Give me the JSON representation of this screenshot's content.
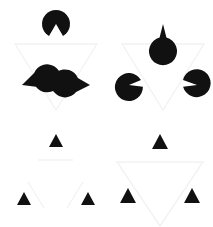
{
  "figure": {
    "background_color": "#ffffff",
    "width": 213,
    "height": 227,
    "grid_rows": 2,
    "grid_cols": 2
  },
  "colors": {
    "inducer_fill": "#111111",
    "illusory_contour": "#f2f2f2",
    "background": "#ffffff"
  },
  "quadrants": [
    {
      "id": "top-left",
      "label": "Pac-man inducers",
      "inducer_type": "pacman-disc",
      "inducer_count": 3,
      "disc_radius": 14,
      "wedge_angle_deg": 60,
      "illusory_shape": "inverted-triangle",
      "contour_visible": "true",
      "inducers": [
        {
          "name": "inducer-top",
          "cx": 56,
          "cy": 24,
          "mouth_direction_deg": 90
        },
        {
          "name": "inducer-bottom-left",
          "cx": 22,
          "cy": 85,
          "mouth_direction_deg": 330
        },
        {
          "name": "inducer-bottom-right",
          "cx": 90,
          "cy": 85,
          "mouth_direction_deg": 210
        }
      ],
      "triangle_points": "15,44 97,44 56,110"
    },
    {
      "id": "top-right",
      "label": "Thin-wedge disc inducers",
      "inducer_type": "thin-wedge-disc",
      "inducer_count": 3,
      "disc_radius": 14,
      "wedge_angle_deg": 28,
      "illusory_shape": "inverted-triangle",
      "contour_visible": "true",
      "inducers": [
        {
          "name": "inducer-top",
          "cx": 56,
          "cy": 24,
          "mouth_direction_deg": 90
        },
        {
          "name": "inducer-bottom-left",
          "cx": 22,
          "cy": 85,
          "mouth_direction_deg": 330
        },
        {
          "name": "inducer-bottom-right",
          "cx": 90,
          "cy": 85,
          "mouth_direction_deg": 210
        }
      ],
      "triangle_points": "15,44 97,44 56,110"
    },
    {
      "id": "bottom-left",
      "label": "Bare wedge inducers",
      "inducer_type": "bare-wedge",
      "inducer_count": 3,
      "wedge_size": 13,
      "wedge_angle_deg": 60,
      "illusory_shape": "inverted-triangle",
      "contour_visible": "partial",
      "inducers": [
        {
          "name": "inducer-top",
          "cx": 56,
          "cy": 28,
          "mouth_direction_deg": 90
        },
        {
          "name": "inducer-bottom-left",
          "cx": 24,
          "cy": 86,
          "mouth_direction_deg": 330
        },
        {
          "name": "inducer-bottom-right",
          "cx": 88,
          "cy": 86,
          "mouth_direction_deg": 210
        }
      ],
      "triangle_points": "15,44 97,44 56,110"
    },
    {
      "id": "bottom-right",
      "label": "Bare wedge inducers with contour",
      "inducer_type": "bare-wedge",
      "inducer_count": 3,
      "wedge_size": 15,
      "wedge_angle_deg": 60,
      "illusory_shape": "inverted-triangle",
      "contour_visible": "true",
      "inducers": [
        {
          "name": "inducer-top",
          "cx": 53,
          "cy": 27,
          "mouth_direction_deg": 90
        },
        {
          "name": "inducer-bottom-left",
          "cx": 21,
          "cy": 84,
          "mouth_direction_deg": 330
        },
        {
          "name": "inducer-bottom-right",
          "cx": 85,
          "cy": 84,
          "mouth_direction_deg": 210
        }
      ],
      "triangle_points": "10,48 96,48 53,112"
    }
  ]
}
